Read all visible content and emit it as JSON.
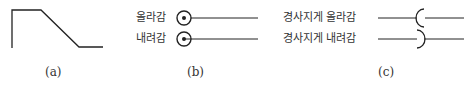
{
  "panels": {
    "a": {
      "caption": "(a)",
      "shape": "slope-profile"
    },
    "b": {
      "caption": "(b)",
      "rows": [
        {
          "label": "올라감",
          "symbol": "dotted-circle-dot-up"
        },
        {
          "label": "내려감",
          "symbol": "dotted-circle-dot-down"
        }
      ]
    },
    "c": {
      "caption": "(c)",
      "rows": [
        {
          "label": "경사지게 올라감",
          "symbol": "left-arc-break"
        },
        {
          "label": "경사지게 내려감",
          "symbol": "right-arc-break"
        }
      ]
    }
  },
  "colors": {
    "stroke": "#222222",
    "text": "#333333"
  }
}
